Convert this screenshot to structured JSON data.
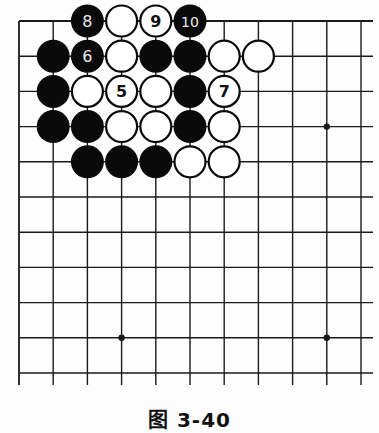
{
  "diagram": {
    "type": "go-board-fragment",
    "columns": 11,
    "rows": 11,
    "edges": [
      "top",
      "left"
    ],
    "colors": {
      "black": "#0a0a0a",
      "white": "#ffffff",
      "line": "#1a1a1a",
      "background": "#fdfdfd"
    },
    "star_points": [
      {
        "col": 9,
        "row": 3
      },
      {
        "col": 3,
        "row": 9
      },
      {
        "col": 9,
        "row": 9
      }
    ],
    "stones": [
      {
        "col": 2,
        "row": 0,
        "color": "black",
        "label": "8"
      },
      {
        "col": 3,
        "row": 0,
        "color": "white",
        "label": ""
      },
      {
        "col": 4,
        "row": 0,
        "color": "white",
        "label": "9"
      },
      {
        "col": 5,
        "row": 0,
        "color": "black",
        "label": "10"
      },
      {
        "col": 1,
        "row": 1,
        "color": "black",
        "label": ""
      },
      {
        "col": 2,
        "row": 1,
        "color": "black",
        "label": "6"
      },
      {
        "col": 3,
        "row": 1,
        "color": "white",
        "label": ""
      },
      {
        "col": 4,
        "row": 1,
        "color": "black",
        "label": ""
      },
      {
        "col": 5,
        "row": 1,
        "color": "black",
        "label": ""
      },
      {
        "col": 6,
        "row": 1,
        "color": "white",
        "label": ""
      },
      {
        "col": 7,
        "row": 1,
        "color": "white",
        "label": ""
      },
      {
        "col": 1,
        "row": 2,
        "color": "black",
        "label": ""
      },
      {
        "col": 2,
        "row": 2,
        "color": "white",
        "label": ""
      },
      {
        "col": 3,
        "row": 2,
        "color": "white",
        "label": "5"
      },
      {
        "col": 4,
        "row": 2,
        "color": "white",
        "label": ""
      },
      {
        "col": 5,
        "row": 2,
        "color": "black",
        "label": ""
      },
      {
        "col": 6,
        "row": 2,
        "color": "white",
        "label": "7"
      },
      {
        "col": 1,
        "row": 3,
        "color": "black",
        "label": ""
      },
      {
        "col": 2,
        "row": 3,
        "color": "black",
        "label": ""
      },
      {
        "col": 3,
        "row": 3,
        "color": "white",
        "label": ""
      },
      {
        "col": 4,
        "row": 3,
        "color": "white",
        "label": ""
      },
      {
        "col": 5,
        "row": 3,
        "color": "black",
        "label": ""
      },
      {
        "col": 6,
        "row": 3,
        "color": "white",
        "label": ""
      },
      {
        "col": 2,
        "row": 4,
        "color": "black",
        "label": ""
      },
      {
        "col": 3,
        "row": 4,
        "color": "black",
        "label": ""
      },
      {
        "col": 4,
        "row": 4,
        "color": "black",
        "label": ""
      },
      {
        "col": 5,
        "row": 4,
        "color": "white",
        "label": ""
      },
      {
        "col": 6,
        "row": 4,
        "color": "white",
        "label": ""
      }
    ]
  },
  "caption": "图 3-40"
}
